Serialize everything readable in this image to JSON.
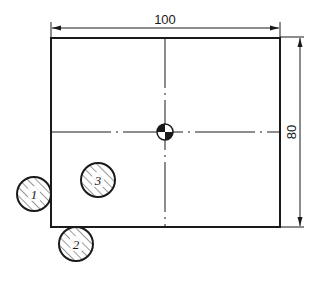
{
  "diagram": {
    "type": "technical-drawing",
    "colors": {
      "line": "#1a1a1a",
      "background": "#ffffff",
      "hatch": "#333333"
    },
    "plate": {
      "x": 51,
      "y": 38,
      "width": 229,
      "height": 189
    },
    "dimensions": {
      "width": {
        "label": "100",
        "orientation": "horizontal"
      },
      "height": {
        "label": "80",
        "orientation": "vertical"
      }
    },
    "center_of_gravity": {
      "icon": "center-of-gravity-symbol",
      "cx": 165,
      "cy": 132,
      "r": 8
    },
    "centerlines": {
      "horizontal_y": 132,
      "vertical_x": 165,
      "style": "dash-dot"
    },
    "pins": [
      {
        "id": "1",
        "label": "1",
        "cx": 34,
        "cy": 194,
        "r": 17,
        "position": "outside-left-edge"
      },
      {
        "id": "2",
        "label": "2",
        "cx": 76,
        "cy": 244,
        "r": 17,
        "position": "outside-bottom-edge"
      },
      {
        "id": "3",
        "label": "3",
        "cx": 98,
        "cy": 180,
        "r": 17,
        "position": "inside-plate"
      }
    ]
  }
}
